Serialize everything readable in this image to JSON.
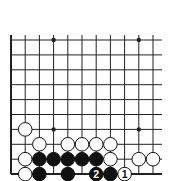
{
  "board": {
    "cols": 11,
    "rows": 10,
    "x0": 11,
    "dx": 14.2,
    "y0": 40,
    "dy": 14.9,
    "top_extend": 5,
    "right_extend": 9,
    "edges": [
      "left",
      "bottom"
    ],
    "line_color": "#222222",
    "hoshi": [
      [
        3,
        0
      ],
      [
        9,
        0
      ],
      [
        3,
        6
      ],
      [
        9,
        6
      ]
    ]
  },
  "stones": [
    {
      "color": "white",
      "col": 1,
      "row": 6,
      "label": ""
    },
    {
      "color": "white",
      "col": 2,
      "row": 7,
      "label": ""
    },
    {
      "color": "white",
      "col": 4,
      "row": 7,
      "label": ""
    },
    {
      "color": "white",
      "col": 5,
      "row": 7,
      "label": ""
    },
    {
      "color": "white",
      "col": 6,
      "row": 7,
      "label": ""
    },
    {
      "color": "white",
      "col": 7,
      "row": 7,
      "label": ""
    },
    {
      "color": "white",
      "col": 1,
      "row": 8,
      "label": ""
    },
    {
      "color": "black",
      "col": 2,
      "row": 8,
      "label": ""
    },
    {
      "color": "black",
      "col": 3,
      "row": 8,
      "label": ""
    },
    {
      "color": "black",
      "col": 4,
      "row": 8,
      "label": ""
    },
    {
      "color": "black",
      "col": 5,
      "row": 8,
      "label": ""
    },
    {
      "color": "black",
      "col": 6,
      "row": 8,
      "label": ""
    },
    {
      "color": "white",
      "col": 7,
      "row": 8,
      "label": ""
    },
    {
      "color": "white",
      "col": 9,
      "row": 8,
      "label": ""
    },
    {
      "color": "white",
      "col": 10,
      "row": 8,
      "label": ""
    },
    {
      "color": "white",
      "col": 1,
      "row": 9,
      "label": ""
    },
    {
      "color": "black",
      "col": 2,
      "row": 9,
      "label": ""
    },
    {
      "color": "black",
      "col": 4,
      "row": 9,
      "label": ""
    },
    {
      "color": "black",
      "col": 6,
      "row": 9,
      "label": "2"
    },
    {
      "color": "black",
      "col": 7,
      "row": 9,
      "label": ""
    },
    {
      "color": "white",
      "col": 8,
      "row": 9,
      "label": "1"
    }
  ]
}
